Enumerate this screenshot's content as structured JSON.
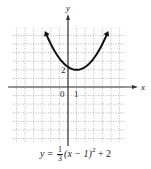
{
  "chart_data": {
    "type": "line",
    "title": "",
    "equation": "y = 1/3 (x − 1)^2 + 2",
    "xlabel": "x",
    "ylabel": "y",
    "xlim": [
      -6.5,
      6.5
    ],
    "ylim": [
      -6.5,
      6.5
    ],
    "grid": true,
    "tick_labels": {
      "origin": "0",
      "x": [
        "1"
      ],
      "y": [
        "2"
      ]
    },
    "series": [
      {
        "name": "y = 1/3 (x - 1)^2 + 2",
        "vertex": [
          1,
          2
        ],
        "x": [
          -3.5,
          -3,
          -2,
          -1,
          0,
          1,
          2,
          3,
          4,
          5,
          5.5
        ],
        "y": [
          8.75,
          7.33,
          5,
          3.33,
          2.33,
          2,
          2.33,
          3.33,
          5,
          7.33,
          8.75
        ]
      }
    ]
  },
  "labels": {
    "x_axis": "x",
    "y_axis": "y",
    "origin": "0",
    "x_tick": "1",
    "y_tick": "2"
  },
  "caption": {
    "lhs": "y =",
    "frac_num": "1",
    "frac_den": "3",
    "rest": "(x − 1)",
    "exp": "2",
    "tail": " + 2"
  }
}
